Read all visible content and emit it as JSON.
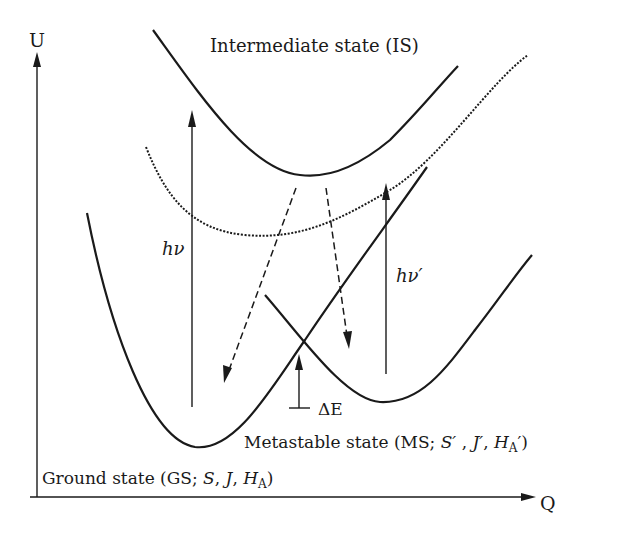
{
  "diagram": {
    "type": "potential-energy-diagram",
    "axes": {
      "y_label": "U",
      "x_label": "Q"
    },
    "curves": [
      {
        "id": "intermediate-state",
        "style": "solid",
        "label": "Intermediate state (IS)"
      },
      {
        "id": "dotted-intermediate",
        "style": "dotted",
        "label": ""
      },
      {
        "id": "ground-state",
        "style": "solid",
        "label": "Ground state (GS; S, J, H_A)"
      },
      {
        "id": "metastable-state",
        "style": "solid",
        "label": "Metastable state (MS; S′, J′, H_A′)"
      }
    ],
    "labels": {
      "is_label": "Intermediate state (IS)",
      "hv": "hν",
      "hv_prime": "hν′",
      "delta_e": "ΔE",
      "ms_prefix": "Metastable state (MS; ",
      "ms_s": "S′",
      "ms_sep1": " , ",
      "ms_j": "J′",
      "ms_sep2": ", ",
      "ms_h": "H",
      "ms_sub": "A",
      "ms_suffix": "′)",
      "gs_prefix": "Ground state (GS; ",
      "gs_s": "S",
      "gs_sep1": ", ",
      "gs_j": "J",
      "gs_sep2": ", ",
      "gs_h": "H",
      "gs_sub": "A",
      "gs_suffix": ")"
    },
    "arrows": [
      {
        "id": "hv-excitation",
        "direction": "up",
        "style": "solid",
        "label": "hν"
      },
      {
        "id": "hv-prime-excitation",
        "direction": "up",
        "style": "solid",
        "label": "hν′"
      },
      {
        "id": "relaxation-to-gs",
        "direction": "down-left",
        "style": "dashed"
      },
      {
        "id": "relaxation-to-ms",
        "direction": "down",
        "style": "dashed"
      },
      {
        "id": "energy-barrier",
        "direction": "up",
        "style": "solid",
        "label": "ΔE"
      }
    ],
    "colors": {
      "stroke": "#1a1a1a",
      "background": "#ffffff"
    }
  }
}
